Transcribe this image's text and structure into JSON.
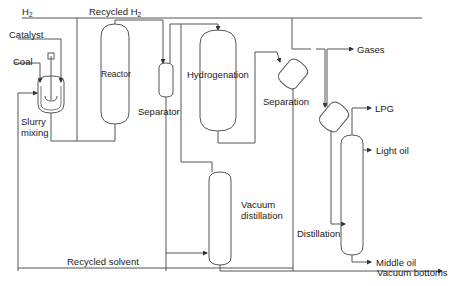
{
  "diagram": {
    "type": "process-flow",
    "inputs": {
      "h2": "H",
      "h2_sub": "2",
      "catalyst": "Catalyst",
      "coal": "Coal"
    },
    "streams": {
      "recycled_h2": "Recycled H",
      "recycled_h2_sub": "2",
      "recycled_solvent": "Recycled solvent"
    },
    "units": {
      "slurry_mixing_line1": "Slurry",
      "slurry_mixing_line2": "mixing",
      "reactor": "Reactor",
      "separator": "Separator",
      "hydrogenation": "Hydrogenation",
      "separation": "Separation",
      "vacuum_distillation_line1": "Vacuum",
      "vacuum_distillation_line2": "distillation",
      "distillation": "Distillation"
    },
    "outputs": {
      "gases": "Gases",
      "lpg": "LPG",
      "light_oil": "Light oil",
      "middle_oil": "Middle oil",
      "vacuum_bottoms": "Vacuum bottoms"
    },
    "line_color": "#555555"
  }
}
